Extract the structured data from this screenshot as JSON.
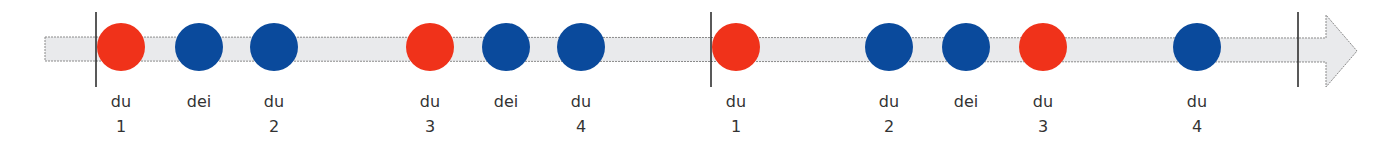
{
  "diagram": {
    "title": "",
    "colors": {
      "bar_fill": "#e9eaec",
      "bar_stroke": "#8a8a8a",
      "barline": "#222222",
      "accent": "#f0321a",
      "normal": "#0a4a9c",
      "text": "#333333"
    },
    "barlines_x": [
      96,
      711,
      1298
    ],
    "beats": [
      {
        "x": 121,
        "accent": true,
        "syllable": "du",
        "count": "1"
      },
      {
        "x": 199,
        "accent": false,
        "syllable": "dei",
        "count": ""
      },
      {
        "x": 274,
        "accent": false,
        "syllable": "du",
        "count": "2"
      },
      {
        "x": 430,
        "accent": true,
        "syllable": "du",
        "count": "3"
      },
      {
        "x": 506,
        "accent": false,
        "syllable": "dei",
        "count": ""
      },
      {
        "x": 581,
        "accent": false,
        "syllable": "du",
        "count": "4"
      },
      {
        "x": 736,
        "accent": true,
        "syllable": "du",
        "count": "1"
      },
      {
        "x": 889,
        "accent": false,
        "syllable": "du",
        "count": "2"
      },
      {
        "x": 966,
        "accent": false,
        "syllable": "dei",
        "count": ""
      },
      {
        "x": 1043,
        "accent": true,
        "syllable": "du",
        "count": "3"
      },
      {
        "x": 1197,
        "accent": false,
        "syllable": "du",
        "count": "4"
      }
    ]
  }
}
